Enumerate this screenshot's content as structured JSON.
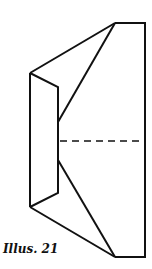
{
  "figure": {
    "caption": "Illus. 21",
    "stroke_color": "#111111",
    "background": "#ffffff"
  }
}
